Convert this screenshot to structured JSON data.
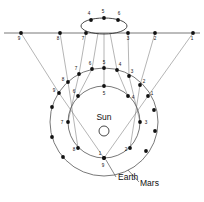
{
  "diagram": {
    "type": "astronomical-orbit-diagram",
    "colors": {
      "stroke": "#555555",
      "point": "#111111",
      "label": "#111111",
      "background": "#ffffff"
    }
  },
  "labels": {
    "sun": "Sun",
    "earth": "Earth",
    "mars": "Mars"
  },
  "sky_line": {
    "description": "horizontal celestial-sphere projection line",
    "y": 33,
    "x_start": 4,
    "x_end": 200,
    "points": [
      {
        "n": "9",
        "x": 21,
        "y": 33,
        "lx": 19,
        "ly": 40
      },
      {
        "n": "8",
        "x": 60,
        "y": 33,
        "lx": 58,
        "ly": 40
      },
      {
        "n": "7",
        "x": 86,
        "y": 33,
        "lx": 83,
        "ly": 40
      },
      {
        "n": "3",
        "x": 128,
        "y": 33,
        "lx": 128,
        "ly": 40
      },
      {
        "n": "2",
        "x": 155,
        "y": 33,
        "lx": 155,
        "ly": 40
      },
      {
        "n": "1",
        "x": 193,
        "y": 33,
        "lx": 192,
        "ly": 40
      }
    ]
  },
  "retrograde_loop": {
    "description": "ellipse tracing the apparent retrograde loop on the sky",
    "cx": 104,
    "cy": 26,
    "rx": 23,
    "ry": 8,
    "points": [
      {
        "n": "4",
        "x": 91,
        "y": 20,
        "lx": 89,
        "ly": 15
      },
      {
        "n": "5",
        "x": 104,
        "y": 18,
        "lx": 103,
        "ly": 13
      },
      {
        "n": "6",
        "x": 118,
        "y": 20,
        "lx": 119,
        "ly": 15
      }
    ]
  },
  "mars_orbit": {
    "name": "Mars",
    "cx": 104,
    "cy": 122,
    "r": 54,
    "label": {
      "text": "Mars",
      "x": 140,
      "y": 186
    },
    "points": [
      {
        "n": "9",
        "x": 59,
        "y": 93,
        "lx": 54,
        "ly": 92
      },
      {
        "n": "8",
        "x": 68,
        "y": 82,
        "lx": 63,
        "ly": 81
      },
      {
        "n": "7",
        "x": 79,
        "y": 74,
        "lx": 76,
        "ly": 70
      },
      {
        "n": "6",
        "x": 92,
        "y": 69,
        "lx": 90,
        "ly": 65
      },
      {
        "n": "5",
        "x": 104,
        "y": 68,
        "lx": 104,
        "ly": 64
      },
      {
        "n": "4",
        "x": 117,
        "y": 70,
        "lx": 120,
        "ly": 66
      },
      {
        "n": "3",
        "x": 129,
        "y": 76,
        "lx": 132,
        "ly": 73
      },
      {
        "n": "2",
        "x": 140,
        "y": 85,
        "lx": 144,
        "ly": 83
      },
      {
        "n": "1",
        "x": 148,
        "y": 96,
        "lx": 152,
        "ly": 95
      }
    ],
    "extra_points": [
      {
        "x": 52,
        "y": 107
      },
      {
        "x": 52,
        "y": 137
      },
      {
        "x": 63,
        "y": 157
      },
      {
        "x": 146,
        "y": 151
      },
      {
        "x": 155,
        "y": 131
      },
      {
        "x": 154,
        "y": 110
      }
    ]
  },
  "earth_orbit": {
    "name": "Earth",
    "cx": 104,
    "cy": 122,
    "r": 36,
    "label": {
      "text": "Earth",
      "x": 118,
      "y": 180
    },
    "sun_label": {
      "text": "Sun",
      "x": 104,
      "y": 120
    },
    "sun_circle": {
      "cx": 104,
      "cy": 131,
      "r": 5
    },
    "points": [
      {
        "n": "5",
        "x": 104,
        "y": 86,
        "lx": 104,
        "ly": 95
      },
      {
        "n": "4",
        "x": 128,
        "y": 96,
        "lx": 133,
        "ly": 99
      },
      {
        "n": "3",
        "x": 140,
        "y": 122,
        "lx": 146,
        "ly": 124
      },
      {
        "n": "2",
        "x": 130,
        "y": 148,
        "lx": 126,
        "ly": 151
      },
      {
        "n": "1",
        "x": 104,
        "y": 158,
        "lx": 100,
        "ly": 155
      },
      {
        "n": "9",
        "x": 104,
        "y": 158,
        "lx": 103,
        "ly": 167
      },
      {
        "n": "8",
        "x": 78,
        "y": 148,
        "lx": 74,
        "ly": 151
      },
      {
        "n": "7",
        "x": 68,
        "y": 122,
        "lx": 62,
        "ly": 124
      },
      {
        "n": "6",
        "x": 78,
        "y": 96,
        "lx": 74,
        "ly": 93
      }
    ]
  },
  "sight_lines": [
    {
      "from_n": "9",
      "x1": 104,
      "y1": 158,
      "x2": 59,
      "y2": 93,
      "x3": 21,
      "y3": 33
    },
    {
      "from_n": "8",
      "x1": 78,
      "y1": 148,
      "x2": 68,
      "y2": 82,
      "x3": 60,
      "y3": 33
    },
    {
      "from_n": "7",
      "x1": 68,
      "y1": 122,
      "x2": 79,
      "y2": 74,
      "x3": 86,
      "y3": 33
    },
    {
      "from_n": "6",
      "x1": 78,
      "y1": 96,
      "x2": 92,
      "y2": 69,
      "x3": 98,
      "y3": 33
    },
    {
      "from_n": "5",
      "x1": 104,
      "y1": 86,
      "x2": 104,
      "y2": 68,
      "x3": 104,
      "y3": 33
    },
    {
      "from_n": "4",
      "x1": 128,
      "y1": 96,
      "x2": 117,
      "y2": 70,
      "x3": 110,
      "y3": 33
    },
    {
      "from_n": "3",
      "x1": 140,
      "y1": 122,
      "x2": 129,
      "y2": 76,
      "x3": 128,
      "y3": 33
    },
    {
      "from_n": "2",
      "x1": 130,
      "y1": 148,
      "x2": 140,
      "y2": 85,
      "x3": 155,
      "y3": 33
    },
    {
      "from_n": "1",
      "x1": 104,
      "y1": 158,
      "x2": 148,
      "y2": 96,
      "x3": 193,
      "y3": 33
    }
  ],
  "leader_lines": [
    {
      "name": "earth-leader",
      "x1": 106,
      "y1": 160,
      "x2": 116,
      "y2": 177
    },
    {
      "name": "mars-leader",
      "x1": 128,
      "y1": 170,
      "x2": 139,
      "y2": 182
    }
  ]
}
